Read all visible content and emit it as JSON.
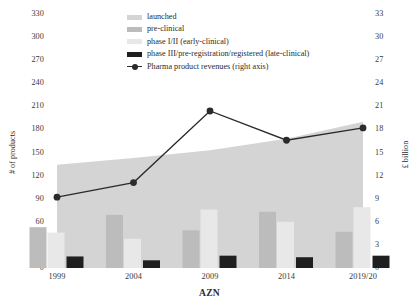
{
  "chart_data": {
    "type": "bar",
    "title": "",
    "subtitle": "",
    "xlabel": "AZN",
    "ylabel": "# of products",
    "y2label": "£ billion",
    "categories": [
      "1999",
      "2004",
      "2009",
      "2014",
      "2019/20"
    ],
    "ylim": [
      0,
      330
    ],
    "ytick_step": 30,
    "yticks": [
      "330",
      "300",
      "270",
      "240",
      "210",
      "180",
      "150",
      "120",
      "90",
      "60",
      "30",
      "0"
    ],
    "y2lim": [
      0,
      33
    ],
    "y2tick_step": 3,
    "y2ticks": [
      "33",
      "30",
      "27",
      "24",
      "21",
      "18",
      "15",
      "12",
      "9",
      "6",
      "3",
      "0"
    ],
    "grid": false,
    "legend_position": "top-center",
    "series": [
      {
        "name": "launched",
        "type": "area",
        "axis": "left",
        "color": "#d4d4d4",
        "values": [
          134,
          143,
          153,
          168,
          190
        ]
      },
      {
        "name": "pre-clinical",
        "type": "bar",
        "axis": "left",
        "color": "#bcbcbc",
        "values": [
          53,
          69,
          49,
          73,
          47
        ]
      },
      {
        "name": "phase I/II (early-clinical)",
        "type": "bar",
        "axis": "left",
        "color": "#e8e8e8",
        "values": [
          46,
          38,
          76,
          60,
          79
        ]
      },
      {
        "name": "phase III/pre-registration/registered (late-clinical)",
        "type": "bar",
        "axis": "left",
        "color": "#1f1f1f",
        "values": [
          15,
          10,
          16,
          14,
          16
        ]
      },
      {
        "name": "Pharma product revenues (right axis)",
        "type": "line",
        "axis": "right",
        "color": "#2b2b2b",
        "values": [
          9.2,
          11.1,
          20.4,
          16.6,
          18.2
        ]
      }
    ]
  },
  "legend": {
    "items": [
      {
        "label": "launched",
        "color": "#d4d4d4",
        "kind": "swatch"
      },
      {
        "label": "pre-clinical",
        "color": "#bcbcbc",
        "kind": "swatch"
      },
      {
        "label": "phase I/II (early-clinical)",
        "color": "#e8e8e8",
        "kind": "swatch"
      },
      {
        "label": "phase III/pre-registration/registered (late-clinical)",
        "color": "#1f1f1f",
        "kind": "swatch"
      },
      {
        "label": "Pharma product revenues (right axis)",
        "color": "#2b2b2b",
        "kind": "line-marker"
      }
    ]
  },
  "colors": {
    "launched": "#d4d4d4",
    "pre_clinical": "#bcbcbc",
    "early_clinical": "#e8e8e8",
    "late_clinical": "#1f1f1f",
    "revenue_line": "#2b2b2b",
    "axis": "#7a7a7a",
    "background": "#ffffff"
  }
}
